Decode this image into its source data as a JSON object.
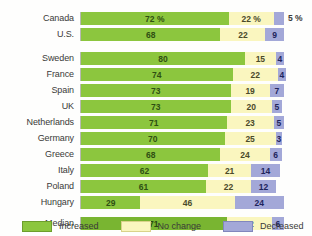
{
  "title_strip": "",
  "legend": {
    "position": "bottom-left",
    "items": [
      {
        "label": "Increased",
        "color": "#8cc63e",
        "name": "increased"
      },
      {
        "label": "No change",
        "color": "#faf6bf",
        "name": "no-change"
      },
      {
        "label": "Decreased",
        "color": "#a3a8d8",
        "name": "decreased"
      }
    ]
  },
  "chart_data": {
    "type": "bar",
    "orientation": "horizontal",
    "stacked": true,
    "title": "",
    "subtitle": "",
    "xlabel": "",
    "ylabel": "",
    "xlim": [
      0,
      100
    ],
    "grid": false,
    "units": "percent",
    "categories": [
      "Canada",
      "U.S.",
      "Sweden",
      "France",
      "Spain",
      "UK",
      "Netherlands",
      "Germany",
      "Greece",
      "Italy",
      "Poland",
      "Hungary",
      "Median"
    ],
    "series": [
      {
        "name": "Increased",
        "color": "#8cc63e",
        "values": [
          72,
          68,
          80,
          74,
          73,
          73,
          71,
          70,
          68,
          62,
          61,
          29,
          71
        ]
      },
      {
        "name": "No change",
        "color": "#faf6bf",
        "values": [
          22,
          22,
          15,
          22,
          19,
          20,
          23,
          25,
          24,
          21,
          22,
          46,
          22
        ]
      },
      {
        "name": "Decreased",
        "color": "#a3a8d8",
        "values": [
          5,
          9,
          4,
          4,
          7,
          5,
          5,
          3,
          6,
          14,
          12,
          24,
          6
        ]
      }
    ],
    "rows": [
      {
        "label": "Canada",
        "group": "north-america",
        "segments": [
          {
            "series": "Increased",
            "value": 72,
            "text": "72 %",
            "label_position": "inside"
          },
          {
            "series": "No change",
            "value": 22,
            "text": "22 %",
            "label_position": "inside"
          },
          {
            "series": "Decreased",
            "value": 5,
            "text": "5 %",
            "label_position": "outside"
          }
        ]
      },
      {
        "label": "U.S.",
        "group": "north-america",
        "segments": [
          {
            "series": "Increased",
            "value": 68,
            "text": "68",
            "label_position": "inside"
          },
          {
            "series": "No change",
            "value": 22,
            "text": "22",
            "label_position": "inside"
          },
          {
            "series": "Decreased",
            "value": 9,
            "text": "9",
            "label_position": "inside"
          }
        ]
      },
      {
        "label": "Sweden",
        "group": "europe",
        "segments": [
          {
            "series": "Increased",
            "value": 80,
            "text": "80",
            "label_position": "inside"
          },
          {
            "series": "No change",
            "value": 15,
            "text": "15",
            "label_position": "inside"
          },
          {
            "series": "Decreased",
            "value": 4,
            "text": "4",
            "label_position": "inside"
          }
        ]
      },
      {
        "label": "France",
        "group": "europe",
        "segments": [
          {
            "series": "Increased",
            "value": 74,
            "text": "74",
            "label_position": "inside"
          },
          {
            "series": "No change",
            "value": 22,
            "text": "22",
            "label_position": "inside"
          },
          {
            "series": "Decreased",
            "value": 4,
            "text": "4",
            "label_position": "inside"
          }
        ]
      },
      {
        "label": "Spain",
        "group": "europe",
        "segments": [
          {
            "series": "Increased",
            "value": 73,
            "text": "73",
            "label_position": "inside"
          },
          {
            "series": "No change",
            "value": 19,
            "text": "19",
            "label_position": "inside"
          },
          {
            "series": "Decreased",
            "value": 7,
            "text": "7",
            "label_position": "inside"
          }
        ]
      },
      {
        "label": "UK",
        "group": "europe",
        "segments": [
          {
            "series": "Increased",
            "value": 73,
            "text": "73",
            "label_position": "inside"
          },
          {
            "series": "No change",
            "value": 20,
            "text": "20",
            "label_position": "inside"
          },
          {
            "series": "Decreased",
            "value": 5,
            "text": "5",
            "label_position": "inside"
          }
        ]
      },
      {
        "label": "Netherlands",
        "group": "europe",
        "segments": [
          {
            "series": "Increased",
            "value": 71,
            "text": "71",
            "label_position": "inside"
          },
          {
            "series": "No change",
            "value": 23,
            "text": "23",
            "label_position": "inside"
          },
          {
            "series": "Decreased",
            "value": 5,
            "text": "5",
            "label_position": "inside"
          }
        ]
      },
      {
        "label": "Germany",
        "group": "europe",
        "segments": [
          {
            "series": "Increased",
            "value": 70,
            "text": "70",
            "label_position": "inside"
          },
          {
            "series": "No change",
            "value": 25,
            "text": "25",
            "label_position": "inside"
          },
          {
            "series": "Decreased",
            "value": 3,
            "text": "3",
            "label_position": "inside"
          }
        ]
      },
      {
        "label": "Greece",
        "group": "europe",
        "segments": [
          {
            "series": "Increased",
            "value": 68,
            "text": "68",
            "label_position": "inside"
          },
          {
            "series": "No change",
            "value": 24,
            "text": "24",
            "label_position": "inside"
          },
          {
            "series": "Decreased",
            "value": 6,
            "text": "6",
            "label_position": "inside"
          }
        ]
      },
      {
        "label": "Italy",
        "group": "europe",
        "segments": [
          {
            "series": "Increased",
            "value": 62,
            "text": "62",
            "label_position": "inside"
          },
          {
            "series": "No change",
            "value": 21,
            "text": "21",
            "label_position": "inside"
          },
          {
            "series": "Decreased",
            "value": 14,
            "text": "14",
            "label_position": "inside"
          }
        ]
      },
      {
        "label": "Poland",
        "group": "europe",
        "segments": [
          {
            "series": "Increased",
            "value": 61,
            "text": "61",
            "label_position": "inside"
          },
          {
            "series": "No change",
            "value": 22,
            "text": "22",
            "label_position": "inside"
          },
          {
            "series": "Decreased",
            "value": 12,
            "text": "12",
            "label_position": "inside"
          }
        ]
      },
      {
        "label": "Hungary",
        "group": "europe",
        "segments": [
          {
            "series": "Increased",
            "value": 29,
            "text": "29",
            "label_position": "inside"
          },
          {
            "series": "No change",
            "value": 46,
            "text": "46",
            "label_position": "inside"
          },
          {
            "series": "Decreased",
            "value": 24,
            "text": "24",
            "label_position": "inside"
          }
        ]
      },
      {
        "label": "Median",
        "group": "summary",
        "segments": [
          {
            "series": "Increased",
            "value": 71,
            "text": "71",
            "label_position": "inside"
          },
          {
            "series": "No change",
            "value": 22,
            "text": "22",
            "label_position": "inside"
          },
          {
            "series": "Decreased",
            "value": 6,
            "text": "6",
            "label_position": "inside"
          }
        ]
      }
    ]
  }
}
